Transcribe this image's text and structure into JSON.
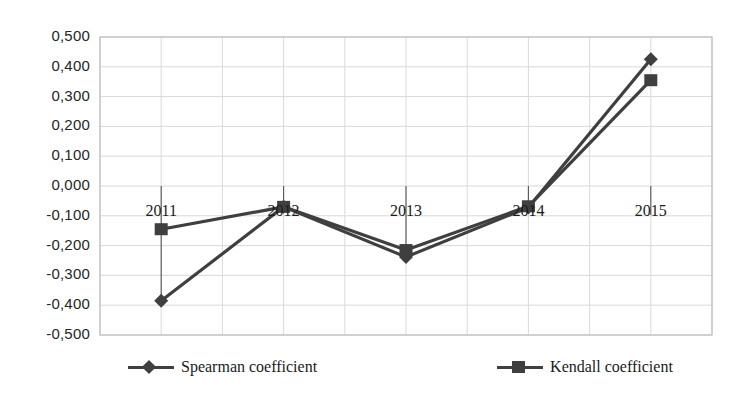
{
  "chart_data": {
    "type": "line",
    "title": "",
    "subtitle": "",
    "xlabel": "",
    "ylabel": "",
    "categories": [
      "2011",
      "2012",
      "2013",
      "2014",
      "2015"
    ],
    "ytick_labels": [
      "0,500",
      "0,400",
      "0,300",
      "0,200",
      "0,100",
      "0,000",
      "-0,100",
      "-0,200",
      "-0,300",
      "-0,400",
      "-0,500"
    ],
    "ytick_values": [
      0.5,
      0.4,
      0.3,
      0.2,
      0.1,
      0.0,
      -0.1,
      -0.2,
      -0.3,
      -0.4,
      -0.5
    ],
    "ylim": [
      -0.5,
      0.5
    ],
    "grid": true,
    "legend_position": "bottom",
    "decimal_separator": ",",
    "series": [
      {
        "name": "Spearman coefficient",
        "marker": "diamond",
        "color": "#3f3f3f",
        "values": [
          -0.385,
          -0.07,
          -0.238,
          -0.072,
          0.425
        ]
      },
      {
        "name": "Kendall coefficient",
        "marker": "square",
        "color": "#3f3f3f",
        "values": [
          -0.145,
          -0.07,
          -0.215,
          -0.068,
          0.355
        ]
      }
    ]
  },
  "legend": {
    "spearman_label": "Spearman coefficient",
    "kendall_label": "Kendall coefficient"
  },
  "colors": {
    "series_line": "#3f3f3f",
    "gridline": "#d9d9d9",
    "plot_border": "#bfbfbf",
    "text": "#1a1a1a",
    "background": "#ffffff"
  }
}
